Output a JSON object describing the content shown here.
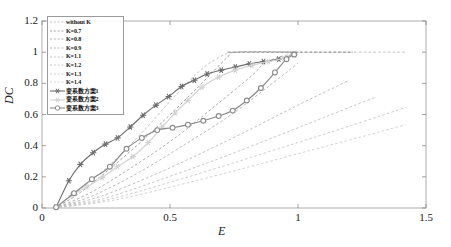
{
  "chart_data": {
    "type": "line",
    "title": "",
    "xlabel": "E",
    "ylabel": "DC",
    "xlim": [
      0,
      1.5
    ],
    "ylim": [
      0,
      1.2
    ],
    "xticks": [
      "0",
      "0.5",
      "1",
      "1.5"
    ],
    "xtick_values": [
      0,
      0.5,
      1,
      1.5
    ],
    "yticks": [
      "0",
      "0.2",
      "0.4",
      "0.6",
      "0.8",
      "1",
      "1.2"
    ],
    "ytick_values": [
      0,
      0.2,
      0.4,
      0.6,
      0.8,
      1.0,
      1.2
    ],
    "grid": false,
    "legend_position": "upper-left",
    "series": [
      {
        "name": "without K",
        "style": "dashed",
        "color": "#b9b9b9",
        "marker": "none",
        "x": [
          0.05,
          0.1,
          0.18,
          0.28,
          0.4,
          0.52,
          0.63,
          0.72,
          0.76,
          1.0,
          1.42
        ],
        "y": [
          0.0,
          0.06,
          0.16,
          0.3,
          0.5,
          0.72,
          0.9,
          0.99,
          1.0,
          1.0,
          1.0
        ]
      },
      {
        "name": "K=0.7",
        "style": "dashed",
        "color": "#8d8d8d",
        "marker": "none",
        "x": [
          0.05,
          0.15,
          0.3,
          0.45,
          0.6,
          0.72,
          0.76,
          1.0
        ],
        "y": [
          0.0,
          0.1,
          0.3,
          0.52,
          0.76,
          0.96,
          1.0,
          1.0
        ]
      },
      {
        "name": "K=0.8",
        "style": "dashed",
        "color": "#a0a0a0",
        "marker": "none",
        "x": [
          0.05,
          0.18,
          0.35,
          0.52,
          0.68,
          0.82,
          0.88,
          1.0
        ],
        "y": [
          0.0,
          0.09,
          0.26,
          0.45,
          0.66,
          0.85,
          0.94,
          1.0
        ]
      },
      {
        "name": "K=0.9",
        "style": "dashed",
        "color": "#aeaeae",
        "marker": "none",
        "x": [
          0.05,
          0.2,
          0.38,
          0.56,
          0.74,
          0.9,
          1.0
        ],
        "y": [
          0.0,
          0.08,
          0.23,
          0.41,
          0.6,
          0.8,
          0.93
        ]
      },
      {
        "name": "K=1.1",
        "style": "dashed",
        "color": "#b5b5b5",
        "marker": "none",
        "x": [
          0.05,
          0.22,
          0.42,
          0.62,
          0.82,
          1.0,
          1.2
        ],
        "y": [
          0.0,
          0.07,
          0.2,
          0.35,
          0.51,
          0.66,
          0.82
        ]
      },
      {
        "name": "K=1.2",
        "style": "dashed",
        "color": "#bdbdbd",
        "marker": "none",
        "x": [
          0.05,
          0.24,
          0.46,
          0.68,
          0.9,
          1.1,
          1.3
        ],
        "y": [
          0.0,
          0.06,
          0.18,
          0.31,
          0.45,
          0.58,
          0.71
        ]
      },
      {
        "name": "K=1.3",
        "style": "dashed",
        "color": "#c4c4c4",
        "marker": "none",
        "x": [
          0.05,
          0.26,
          0.5,
          0.74,
          0.98,
          1.2,
          1.42
        ],
        "y": [
          0.0,
          0.055,
          0.165,
          0.285,
          0.41,
          0.525,
          0.645
        ]
      },
      {
        "name": "K=1.4",
        "style": "dashed",
        "color": "#cbcbcb",
        "marker": "none",
        "x": [
          0.05,
          0.28,
          0.54,
          0.8,
          1.06,
          1.3,
          1.42
        ],
        "y": [
          0.0,
          0.05,
          0.15,
          0.26,
          0.375,
          0.48,
          0.535
        ]
      },
      {
        "name": "变系数方案1",
        "style": "solid",
        "color": "#6e6e6e",
        "marker": "star",
        "x": [
          0.055,
          0.105,
          0.15,
          0.2,
          0.248,
          0.295,
          0.345,
          0.395,
          0.445,
          0.495,
          0.545,
          0.595,
          0.645,
          0.7,
          0.755,
          0.81,
          0.865,
          0.925,
          0.985
        ],
        "y": [
          0.005,
          0.175,
          0.28,
          0.355,
          0.41,
          0.45,
          0.52,
          0.595,
          0.66,
          0.715,
          0.78,
          0.82,
          0.86,
          0.885,
          0.905,
          0.925,
          0.94,
          0.955,
          0.985
        ]
      },
      {
        "name": "变系数方案2",
        "style": "solid",
        "color": "#d2d2d2",
        "marker": "star",
        "x": [
          0.055,
          0.115,
          0.175,
          0.235,
          0.295,
          0.355,
          0.415,
          0.47,
          0.52,
          0.57,
          0.625,
          0.69,
          0.755,
          0.82,
          0.885,
          0.945,
          0.985
        ],
        "y": [
          0.005,
          0.08,
          0.135,
          0.195,
          0.265,
          0.33,
          0.42,
          0.52,
          0.61,
          0.69,
          0.775,
          0.84,
          0.885,
          0.915,
          0.94,
          0.96,
          0.985
        ]
      },
      {
        "name": "变系数方案3",
        "style": "solid",
        "color": "#8a8a8a",
        "marker": "circle",
        "x": [
          0.055,
          0.125,
          0.195,
          0.265,
          0.33,
          0.39,
          0.45,
          0.51,
          0.57,
          0.63,
          0.69,
          0.745,
          0.8,
          0.855,
          0.91,
          0.955,
          0.985
        ],
        "y": [
          0.005,
          0.095,
          0.185,
          0.265,
          0.38,
          0.45,
          0.5,
          0.515,
          0.535,
          0.56,
          0.59,
          0.625,
          0.69,
          0.77,
          0.87,
          0.955,
          0.985
        ]
      }
    ],
    "annotations": [
      {
        "name": "saturation-line",
        "type": "horizontal-dashed",
        "y": 1.0,
        "x_start": 0.725,
        "x_end": 1.215,
        "color": "#6e6e6e"
      }
    ]
  },
  "axes": {
    "y_title": "DC",
    "x_title": "E"
  },
  "legend": {
    "items": [
      {
        "label": "without K",
        "marker": "none",
        "style": "dashed",
        "color": "#b9b9b9"
      },
      {
        "label": "K=0.7",
        "marker": "none",
        "style": "dashed",
        "color": "#8d8d8d"
      },
      {
        "label": "K=0.8",
        "marker": "none",
        "style": "dashed",
        "color": "#a0a0a0"
      },
      {
        "label": "K=0.9",
        "marker": "none",
        "style": "dashed",
        "color": "#aeaeae"
      },
      {
        "label": "K=1.1",
        "marker": "none",
        "style": "dashed",
        "color": "#b5b5b5"
      },
      {
        "label": "K=1.2",
        "marker": "none",
        "style": "dashed",
        "color": "#bdbdbd"
      },
      {
        "label": "K=1.3",
        "marker": "none",
        "style": "dashed",
        "color": "#c4c4c4"
      },
      {
        "label": "K=1.4",
        "marker": "none",
        "style": "dashed",
        "color": "#cbcbcb"
      },
      {
        "label": "变系数方案1",
        "marker": "star",
        "style": "solid",
        "color": "#6e6e6e"
      },
      {
        "label": "变系数方案2",
        "marker": "star",
        "style": "solid",
        "color": "#d2d2d2"
      },
      {
        "label": "变系数方案3",
        "marker": "circle",
        "style": "solid",
        "color": "#8a8a8a"
      }
    ]
  }
}
